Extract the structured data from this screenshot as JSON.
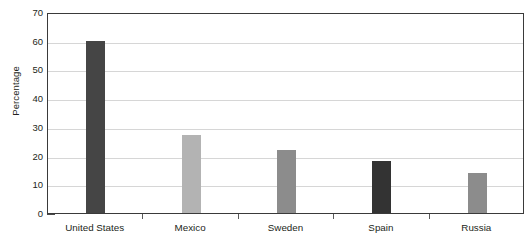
{
  "chart_data": {
    "type": "bar",
    "title": "",
    "subtitle": "",
    "xlabel": "",
    "ylabel": "Percentage",
    "categories": [
      "United States",
      "Mexico",
      "Sweden",
      "Spain",
      "Russia"
    ],
    "values": [
      60,
      27,
      22,
      18,
      14
    ],
    "series": [
      {
        "name": "Percentage",
        "values": [
          60,
          27,
          22,
          18,
          14
        ]
      }
    ],
    "bar_colors": [
      "#454545",
      "#b3b3b3",
      "#8c8c8c",
      "#333333",
      "#8c8c8c"
    ],
    "ylim": [
      0,
      70
    ],
    "y_ticks": [
      0,
      10,
      20,
      30,
      40,
      50,
      60,
      70
    ],
    "y_tick_labels": [
      "0",
      "10",
      "20",
      "30",
      "40",
      "50",
      "60",
      "70"
    ],
    "grid": true,
    "grid_axis": "y",
    "legend": false,
    "legend_position": "none",
    "frame": true,
    "background_color": "#ffffff",
    "axis_color": "#3a3a3a",
    "grid_color": "#d6d6d6",
    "text_color": "#231f20"
  }
}
